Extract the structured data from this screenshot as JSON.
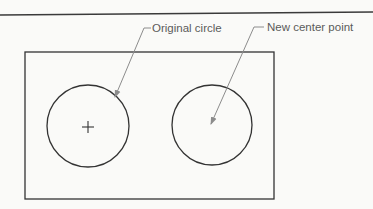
{
  "figure": {
    "width": 373,
    "height": 209,
    "background": "#fafaf8",
    "colors": {
      "shape_stroke": "#333333",
      "leader_stroke": "#8c8c8c",
      "label_text": "#5a5a5a"
    }
  },
  "header_rule": {
    "x1": 0,
    "y1": 15,
    "x2": 373,
    "y2": 12
  },
  "frame": {
    "x": 25,
    "y": 52,
    "width": 249,
    "height": 147
  },
  "shapes": {
    "original_circle": {
      "cx": 88,
      "cy": 126,
      "r": 41
    },
    "center_mark": {
      "cx": 88,
      "cy": 127,
      "size": 6
    },
    "new_circle": {
      "cx": 212,
      "cy": 125,
      "r": 40
    }
  },
  "callouts": [
    {
      "id": "original-circle",
      "label": "Original circle",
      "text_x": 152,
      "text_y": 32,
      "stub": {
        "x1": 144,
        "y1": 28,
        "x2": 151,
        "y2": 28
      },
      "leader": {
        "x1": 144,
        "y1": 28,
        "x2": 115,
        "y2": 97
      }
    },
    {
      "id": "new-center-point",
      "label": "New center point",
      "text_x": 267,
      "text_y": 31,
      "stub": {
        "x1": 254,
        "y1": 27,
        "x2": 264,
        "y2": 27
      },
      "leader": {
        "x1": 254,
        "y1": 27,
        "x2": 211,
        "y2": 124
      }
    }
  ]
}
